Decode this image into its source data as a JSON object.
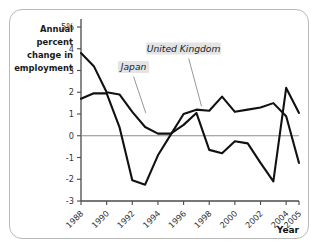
{
  "chart_data": {
    "type": "line",
    "title": "",
    "xlabel": "Year",
    "ylabel": "Annual percent change in employment",
    "ylabel_lines": [
      "Annual",
      "percent",
      "change in",
      "employment"
    ],
    "x": [
      1988,
      1989,
      1990,
      1991,
      1992,
      1993,
      1994,
      1995,
      1996,
      1997,
      1998,
      1999,
      2000,
      2001,
      2002,
      2003,
      2004,
      2005
    ],
    "xlim": [
      1988,
      2005
    ],
    "ylim": [
      -3,
      5
    ],
    "ytick_labels": [
      "5%",
      "4",
      "3",
      "2",
      "1",
      "0",
      "-1",
      "-2",
      "-3"
    ],
    "ytick_values": [
      5,
      4,
      3,
      2,
      1,
      0,
      -1,
      -2,
      -3
    ],
    "xtick_labels": [
      "1988",
      "1990",
      "1992",
      "1994",
      "1996",
      "1998",
      "2000",
      "2002",
      "2004",
      "2005"
    ],
    "xtick_values": [
      1988,
      1990,
      1992,
      1994,
      1996,
      1998,
      2000,
      2002,
      2004,
      2005
    ],
    "grid": false,
    "legend_position": "inline-callout",
    "zero_line": 0,
    "series": [
      {
        "name": "Japan",
        "label": "Japan",
        "values": [
          3.8,
          3.2,
          2.0,
          1.9,
          1.1,
          0.4,
          0.1,
          0.1,
          0.5,
          1.05,
          -0.65,
          -0.8,
          -0.25,
          -0.35,
          -1.25,
          -2.1,
          2.2,
          1.05
        ]
      },
      {
        "name": "United Kingdom",
        "label": "United Kingdom",
        "values": [
          1.7,
          1.95,
          1.95,
          0.4,
          -2.05,
          -2.25,
          -0.9,
          0.05,
          1.0,
          1.2,
          1.15,
          1.8,
          1.1,
          1.2,
          1.3,
          1.5,
          0.9,
          -1.25
        ]
      }
    ],
    "annotations": [
      {
        "text": "Japan",
        "x": 1992.1,
        "y": 3.05
      },
      {
        "text": "United Kingdom",
        "x": 1996.0,
        "y": 3.9
      }
    ]
  }
}
